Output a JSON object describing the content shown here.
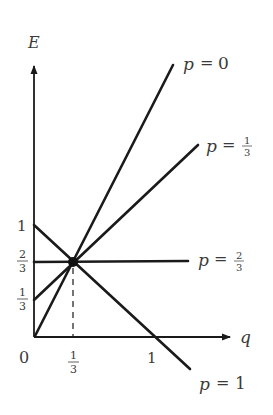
{
  "diagram": {
    "axes": {
      "y_label": "E",
      "x_label": "q",
      "origin_label": "0",
      "x_ticks": [
        {
          "num": "1",
          "den": "3",
          "frac": true
        },
        {
          "text": "1",
          "frac": false
        }
      ],
      "y_ticks": [
        {
          "text": "1",
          "frac": false
        },
        {
          "num": "2",
          "den": "3",
          "frac": true
        },
        {
          "num": "1",
          "den": "3",
          "frac": true
        }
      ]
    },
    "lines": [
      {
        "id": "p0",
        "label_prefix": "p",
        "eq": "=",
        "value": "0",
        "frac": false
      },
      {
        "id": "p13",
        "label_prefix": "p",
        "eq": "=",
        "num": "1",
        "den": "3",
        "frac": true
      },
      {
        "id": "p23",
        "label_prefix": "p",
        "eq": "=",
        "num": "2",
        "den": "3",
        "frac": true
      },
      {
        "id": "p1",
        "label_prefix": "p",
        "eq": "=",
        "value": "1",
        "frac": false
      }
    ],
    "intersection": {
      "q": "1/3",
      "E": "2/3"
    },
    "colors": {
      "ink": "#1a1a1a",
      "text": "#3a3a3a",
      "background": "#ffffff"
    }
  }
}
